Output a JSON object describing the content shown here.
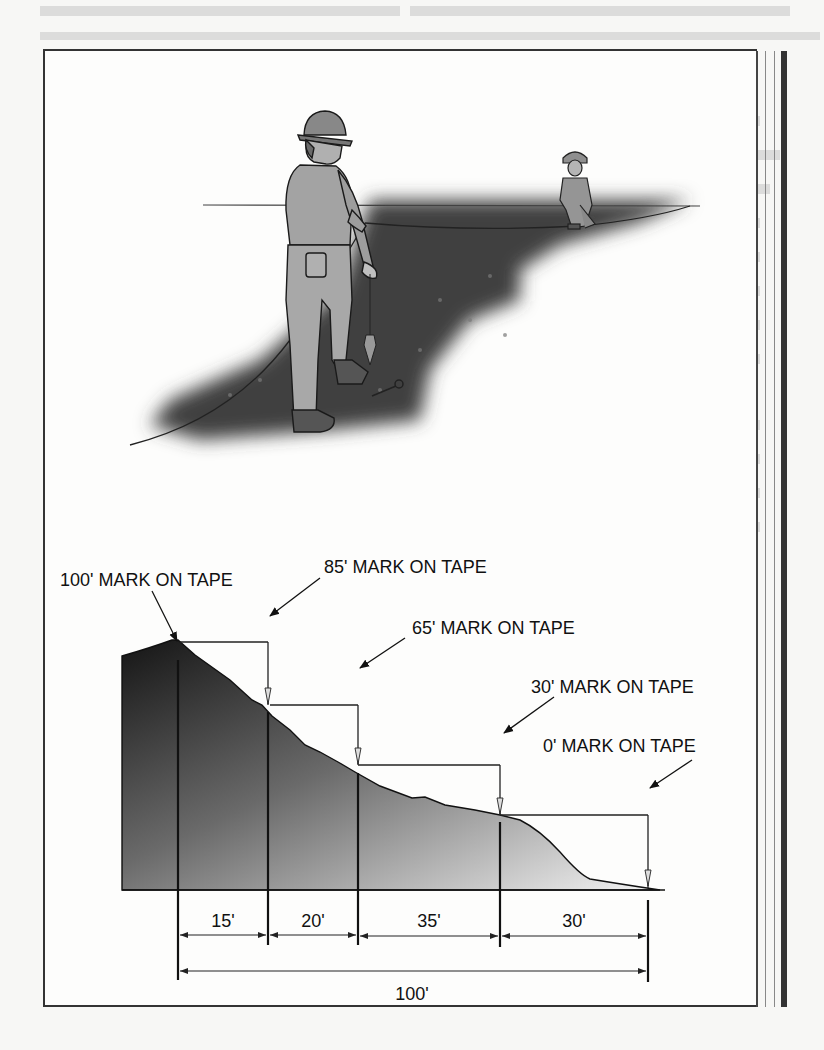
{
  "figure": {
    "illustration": {
      "description": "Two surveyors measuring down a slope with a tape and plumb bob",
      "figures": [
        "standing-surveyor-with-plumb-bob",
        "crouching-surveyor-holding-tape-end"
      ]
    },
    "callouts": [
      {
        "id": "mark-100",
        "label": "100' MARK ON TAPE"
      },
      {
        "id": "mark-85",
        "label": "85' MARK ON TAPE"
      },
      {
        "id": "mark-65",
        "label": "65' MARK ON TAPE"
      },
      {
        "id": "mark-30",
        "label": "30' MARK ON TAPE"
      },
      {
        "id": "mark-0",
        "label": "0' MARK ON TAPE"
      }
    ],
    "segments": [
      {
        "label": "15'",
        "value": 15
      },
      {
        "label": "20'",
        "value": 20
      },
      {
        "label": "35'",
        "value": 35
      },
      {
        "label": "30'",
        "value": 30
      }
    ],
    "total": {
      "label": "100'",
      "value": 100
    }
  },
  "colors": {
    "ink": "#111111",
    "terrain_dark": "#1a1a1a",
    "terrain_light": "#f2f2f2",
    "ground_shadow": "#3a3a3a",
    "clothing": "#9a9a9a"
  }
}
